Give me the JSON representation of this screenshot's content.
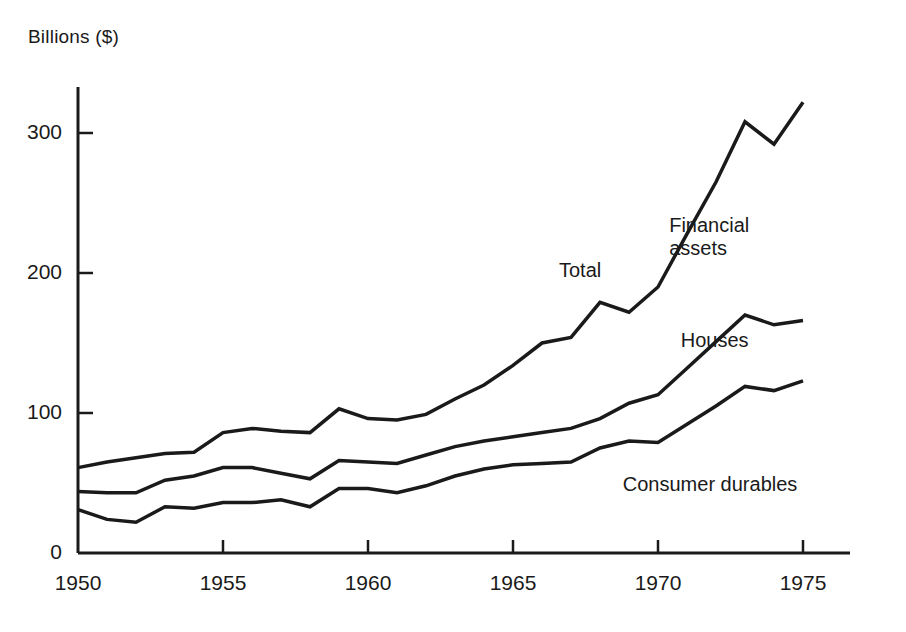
{
  "chart_data": {
    "type": "line",
    "title": "",
    "subtitle": "",
    "ylabel": "Billions ($)",
    "xlabel": "",
    "grid": false,
    "legend_position": "inline-annotations",
    "xlim": [
      1950,
      1976
    ],
    "ylim": [
      0,
      330
    ],
    "y_ticks": [
      0,
      100,
      200,
      300
    ],
    "y_tick_labels": [
      "0",
      "100",
      "200",
      "300"
    ],
    "x_ticks": [
      1950,
      1955,
      1960,
      1965,
      1970,
      1975
    ],
    "x_tick_labels": [
      "1950",
      "1955",
      "1960",
      "1965",
      "1970",
      "1975"
    ],
    "x": [
      1950,
      1951,
      1952,
      1953,
      1954,
      1955,
      1956,
      1957,
      1958,
      1959,
      1960,
      1961,
      1962,
      1963,
      1964,
      1965,
      1966,
      1967,
      1968,
      1969,
      1970,
      1971,
      1972,
      1973,
      1974,
      1975
    ],
    "series": [
      {
        "name": "Total",
        "annotation": "Total",
        "annotation2": "Financial assets",
        "values": [
          61,
          65,
          68,
          71,
          72,
          86,
          89,
          87,
          86,
          103,
          96,
          95,
          99,
          110,
          120,
          134,
          150,
          154,
          179,
          172,
          190,
          228,
          265,
          308,
          292,
          322
        ]
      },
      {
        "name": "Houses",
        "annotation": "Houses",
        "values": [
          44,
          43,
          43,
          52,
          55,
          61,
          61,
          57,
          53,
          66,
          65,
          64,
          70,
          76,
          80,
          83,
          86,
          89,
          96,
          107,
          113,
          132,
          151,
          170,
          163,
          166
        ]
      },
      {
        "name": "Consumer durables",
        "annotation": "Consumer durables",
        "values": [
          31,
          24,
          22,
          33,
          32,
          36,
          36,
          38,
          33,
          46,
          46,
          43,
          48,
          55,
          60,
          63,
          64,
          65,
          75,
          80,
          79,
          92,
          105,
          119,
          116,
          123
        ]
      }
    ],
    "annotations": [
      {
        "text": "Total",
        "x": 1967.0,
        "y": 200
      },
      {
        "text": "Financial\nassets",
        "x": 1970.8,
        "y": 232
      },
      {
        "text": "Houses",
        "x": 1971.2,
        "y": 150
      },
      {
        "text": "Consumer durables",
        "x": 1969.2,
        "y": 47
      }
    ],
    "colors": {
      "line": "#1a1a1a",
      "axis": "#1a1a1a",
      "background": "#ffffff",
      "text": "#1a1a1a"
    },
    "line_width": 3.5
  }
}
